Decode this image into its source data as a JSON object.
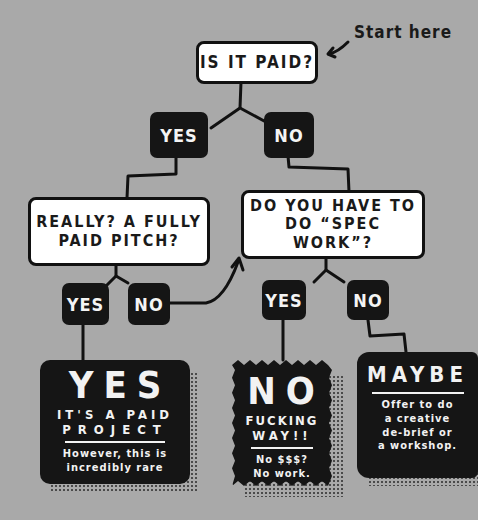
{
  "title_annotation": "Start here",
  "colors": {
    "background": "#a9a9a9",
    "question_fill": "#ffffff",
    "answer_fill": "#151515",
    "line": "#111111",
    "text_dark": "#1a1a1a",
    "text_light": "#f4f4f4"
  },
  "nodes": {
    "q1": {
      "text": "IS IT PAID?"
    },
    "q1_yes": {
      "text": "YES"
    },
    "q1_no": {
      "text": "NO"
    },
    "q2": {
      "line1": "REALLY? A FULLY",
      "line2": "PAID PITCH?"
    },
    "q2_yes": {
      "text": "YES"
    },
    "q2_no": {
      "text": "NO"
    },
    "q3": {
      "line1": "DO YOU HAVE TO",
      "line2": "DO “SPEC WORK”?"
    },
    "q3_yes": {
      "text": "YES"
    },
    "q3_no": {
      "text": "NO"
    }
  },
  "results": {
    "yes": {
      "headline": "YES",
      "sub1": "IT'S A PAID",
      "sub2": "PROJECT",
      "note1": "However, this is",
      "note2": "incredibly rare"
    },
    "no": {
      "headline": "NO",
      "sub1": "FUCKING",
      "sub2": "WAY!!",
      "note1": "No $$$?",
      "note2": "No work."
    },
    "maybe": {
      "headline": "MAYBE",
      "note1": "Offer to do",
      "note2": "a creative",
      "note3": "de-brief or",
      "note4": "a workshop."
    }
  }
}
